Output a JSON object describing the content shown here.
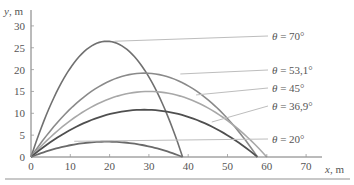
{
  "chart_data": {
    "type": "line",
    "title": "",
    "xlabel": "x, m",
    "ylabel": "y, m",
    "xlabel_var": "x",
    "xlabel_unit": ", m",
    "ylabel_var": "y",
    "ylabel_unit": ", m",
    "xlim": [
      0,
      75
    ],
    "ylim": [
      0,
      32
    ],
    "x_ticks": [
      0,
      10,
      20,
      30,
      40,
      50,
      60,
      70
    ],
    "y_ticks": [
      0,
      5,
      10,
      15,
      20,
      25,
      30
    ],
    "grid": false,
    "legend_position": "right (inline labels with leader lines)",
    "g": 10,
    "v0_squared": 600,
    "series": [
      {
        "name": "θ = 70°",
        "angle_deg": 70,
        "label": "θ = 70°",
        "range_m": 38.6,
        "max_height_m": 26.5,
        "color": "#707070",
        "width": 1.6
      },
      {
        "name": "θ = 53,1°",
        "angle_deg": 53.1,
        "label": "θ = 53,1°",
        "range_m": 57.6,
        "max_height_m": 19.2,
        "color": "#8a8a8a",
        "width": 1.6
      },
      {
        "name": "θ = 45°",
        "angle_deg": 45,
        "label": "θ = 45°",
        "range_m": 60.0,
        "max_height_m": 15.0,
        "color": "#a8a8a8",
        "width": 1.6
      },
      {
        "name": "θ = 36,9°",
        "angle_deg": 36.9,
        "label": "θ = 36,9°",
        "range_m": 57.6,
        "max_height_m": 10.8,
        "color": "#4f4f4f",
        "width": 1.8
      },
      {
        "name": "θ = 20°",
        "angle_deg": 20,
        "label": "θ = 20°",
        "range_m": 38.6,
        "max_height_m": 3.5,
        "color": "#6a6a6a",
        "width": 1.8
      }
    ],
    "labels": [
      {
        "text_var": "θ",
        "text_rest": " = 70°",
        "y_px": 36
      },
      {
        "text_var": "θ",
        "text_rest": " = 53,1°",
        "y_px": 70
      },
      {
        "text_var": "θ",
        "text_rest": " = 45°",
        "y_px": 88
      },
      {
        "text_var": "θ",
        "text_rest": " = 36,9°",
        "y_px": 106
      },
      {
        "text_var": "θ",
        "text_rest": " = 20°",
        "y_px": 139
      }
    ]
  },
  "colors": {
    "axis": "#777777",
    "text": "#555555",
    "leader": "#bdbdbd",
    "bottom_rule": "#c8c8c8"
  }
}
